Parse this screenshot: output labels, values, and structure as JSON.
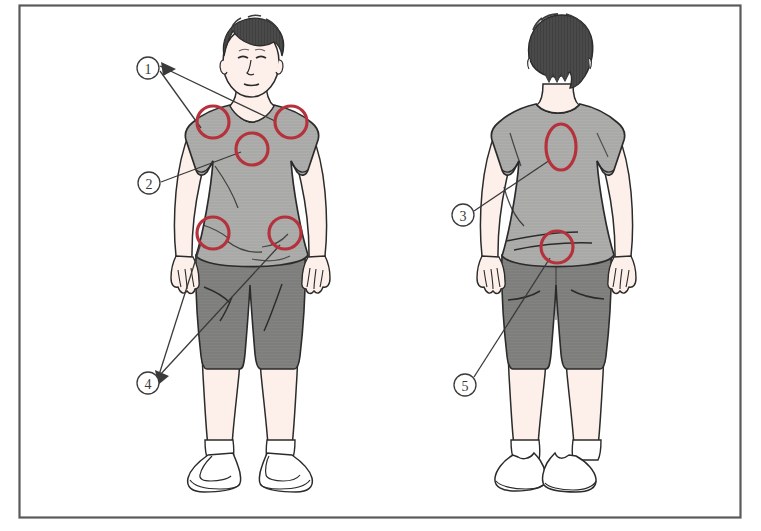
{
  "figure": {
    "frame": {
      "border_color": "#5a5a5a",
      "background": "#ffffff"
    },
    "palette": {
      "skin": "#fdf0ea",
      "skin_shade": "#f6e0d6",
      "shirt": "#a9aaa7",
      "shirt_shade": "#9a9b98",
      "shorts": "#7e7f7c",
      "shorts_shade": "#6f706d",
      "hair": "#4a4a4a",
      "hair_back": "#444444",
      "outline": "#2b2b2b",
      "annotation_red": "#b5323c",
      "leader_line": "#3a3a3a",
      "shoe": "#ffffff"
    },
    "views": [
      {
        "name": "front-view",
        "label": "front"
      },
      {
        "name": "back-view",
        "label": "back"
      }
    ],
    "markers": [
      {
        "id": "marker-1",
        "label": "1",
        "view": "front-view",
        "cx": 148,
        "cy": 68,
        "r": 11,
        "targets": [
          "left-shoulder",
          "right-shoulder"
        ]
      },
      {
        "id": "marker-2",
        "label": "2",
        "view": "front-view",
        "cx": 149,
        "cy": 183,
        "r": 11,
        "targets": [
          "chest"
        ]
      },
      {
        "id": "marker-3",
        "label": "3",
        "view": "back-view",
        "cx": 463,
        "cy": 215,
        "r": 11,
        "targets": [
          "upper-back"
        ]
      },
      {
        "id": "marker-4",
        "label": "4",
        "view": "front-view",
        "cx": 148,
        "cy": 383,
        "r": 11,
        "targets": [
          "left-hip",
          "right-hip"
        ]
      },
      {
        "id": "marker-5",
        "label": "5",
        "view": "back-view",
        "cx": 465,
        "cy": 385,
        "r": 11,
        "targets": [
          "lower-back"
        ]
      }
    ],
    "highlight_circles": [
      {
        "id": "left-shoulder",
        "view": "front-view",
        "cx": 213,
        "cy": 122,
        "rx": 16,
        "ry": 16,
        "marker": "1"
      },
      {
        "id": "right-shoulder",
        "view": "front-view",
        "cx": 291,
        "cy": 122,
        "rx": 16,
        "ry": 16,
        "marker": "1"
      },
      {
        "id": "chest",
        "view": "front-view",
        "cx": 252,
        "cy": 149,
        "rx": 16,
        "ry": 16,
        "marker": "2"
      },
      {
        "id": "left-hip",
        "view": "front-view",
        "cx": 213,
        "cy": 233,
        "rx": 16,
        "ry": 16,
        "marker": "4"
      },
      {
        "id": "right-hip",
        "view": "front-view",
        "cx": 285,
        "cy": 233,
        "rx": 16,
        "ry": 16,
        "marker": "4"
      },
      {
        "id": "upper-back",
        "view": "back-view",
        "cx": 561,
        "cy": 147,
        "rx": 15,
        "ry": 23,
        "marker": "3"
      },
      {
        "id": "lower-back",
        "view": "back-view",
        "cx": 557,
        "cy": 247,
        "rx": 16,
        "ry": 16,
        "marker": "5"
      }
    ]
  }
}
